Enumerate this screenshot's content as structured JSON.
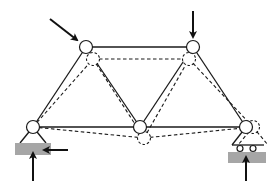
{
  "diagram": {
    "title": "",
    "colors": {
      "line": "#1a1a1a",
      "ground": "#a6a6a6",
      "background": "#ffffff"
    },
    "nodes": [
      {
        "id": "A",
        "role": "bottom-left (pinned support)",
        "x": 33,
        "y": 127
      },
      {
        "id": "B",
        "role": "top-left",
        "x": 86,
        "y": 47
      },
      {
        "id": "C",
        "role": "top-right",
        "x": 193,
        "y": 47
      },
      {
        "id": "D",
        "role": "bottom-middle",
        "x": 140,
        "y": 127
      },
      {
        "id": "E",
        "role": "bottom-right (roller support)",
        "x": 246,
        "y": 127
      }
    ],
    "deformed_nodes": [
      {
        "id": "A'",
        "x": 33,
        "y": 127
      },
      {
        "id": "B'",
        "x": 93,
        "y": 59
      },
      {
        "id": "C'",
        "x": 189,
        "y": 59
      },
      {
        "id": "D'",
        "x": 144,
        "y": 138
      },
      {
        "id": "E'",
        "x": 253,
        "y": 127
      }
    ],
    "members": [
      [
        "A",
        "B"
      ],
      [
        "B",
        "C"
      ],
      [
        "A",
        "D"
      ],
      [
        "B",
        "D"
      ],
      [
        "D",
        "C"
      ],
      [
        "C",
        "E"
      ],
      [
        "D",
        "E"
      ]
    ],
    "loads": [
      {
        "at": "B",
        "direction": "diagonal down-right",
        "type": "applied load"
      },
      {
        "at": "C",
        "direction": "down",
        "type": "applied load"
      }
    ],
    "reactions": [
      {
        "at": "A",
        "direction": "up",
        "type": "vertical reaction"
      },
      {
        "at": "A",
        "direction": "left",
        "type": "horizontal reaction"
      },
      {
        "at": "E",
        "direction": "up",
        "type": "vertical reaction"
      }
    ],
    "supports": [
      {
        "at": "A",
        "type": "pin"
      },
      {
        "at": "E",
        "type": "roller"
      }
    ]
  }
}
